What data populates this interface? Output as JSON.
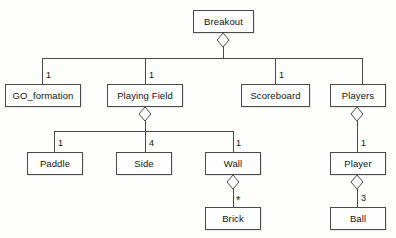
{
  "diagram": {
    "title": "Breakout",
    "type": "uml-aggregation-hierarchy",
    "background_color": "#fdfdfc",
    "line_color": "#4a4a4a",
    "text_color": "#131313",
    "nodes": [
      {
        "id": "breakout",
        "label": "Breakout",
        "x": 193,
        "y": 10,
        "w": 61,
        "h": 23
      },
      {
        "id": "go_formation",
        "label": "GO_formation",
        "x": 5,
        "y": 84,
        "w": 76,
        "h": 23
      },
      {
        "id": "playing_field",
        "label": "Playing Field",
        "x": 107,
        "y": 84,
        "w": 76,
        "h": 23
      },
      {
        "id": "scoreboard",
        "label": "Scoreboard",
        "x": 241,
        "y": 84,
        "w": 69,
        "h": 23
      },
      {
        "id": "players",
        "label": "Players",
        "x": 330,
        "y": 84,
        "w": 56,
        "h": 23
      },
      {
        "id": "paddle",
        "label": "Paddle",
        "x": 27,
        "y": 152,
        "w": 56,
        "h": 23
      },
      {
        "id": "side",
        "label": "Side",
        "x": 116,
        "y": 152,
        "w": 56,
        "h": 23
      },
      {
        "id": "wall",
        "label": "Wall",
        "x": 205,
        "y": 152,
        "w": 56,
        "h": 23
      },
      {
        "id": "player",
        "label": "Player",
        "x": 330,
        "y": 152,
        "w": 56,
        "h": 23
      },
      {
        "id": "brick",
        "label": "Brick",
        "x": 205,
        "y": 207,
        "w": 56,
        "h": 23
      },
      {
        "id": "ball",
        "label": "Ball",
        "x": 330,
        "y": 207,
        "w": 56,
        "h": 23
      }
    ],
    "multiplicities": [
      {
        "id": "mult-go-formation",
        "label": "1",
        "x": 46,
        "y": 71
      },
      {
        "id": "mult-playing-field",
        "label": "1",
        "x": 149,
        "y": 71
      },
      {
        "id": "mult-scoreboard",
        "label": "1",
        "x": 279,
        "y": 71
      },
      {
        "id": "mult-paddle",
        "label": "1",
        "x": 58,
        "y": 139
      },
      {
        "id": "mult-side",
        "label": "4",
        "x": 149,
        "y": 139
      },
      {
        "id": "mult-wall",
        "label": "1",
        "x": 236,
        "y": 139
      },
      {
        "id": "mult-player",
        "label": "1",
        "x": 361,
        "y": 139
      },
      {
        "id": "mult-brick",
        "label": "*",
        "x": 236,
        "y": 195
      },
      {
        "id": "mult-ball",
        "label": "3",
        "x": 361,
        "y": 194
      }
    ],
    "diamonds": [
      {
        "id": "diamond-breakout",
        "cx": 223,
        "cy": 40
      },
      {
        "id": "diamond-playing-field",
        "cx": 145,
        "cy": 114
      },
      {
        "id": "diamond-players",
        "cx": 357,
        "cy": 114
      },
      {
        "id": "diamond-wall",
        "cx": 233,
        "cy": 182
      },
      {
        "id": "diamond-player",
        "cx": 357,
        "cy": 182
      }
    ],
    "edges": [
      {
        "id": "edge-breakout-bus",
        "points": "223,46 223,58"
      },
      {
        "id": "edge-bus-top",
        "points": "42,58 362,58"
      },
      {
        "id": "edge-drop-go-formation",
        "points": "42,58 42,84"
      },
      {
        "id": "edge-drop-playing-field",
        "points": "145,58 145,84"
      },
      {
        "id": "edge-drop-scoreboard",
        "points": "275,58 275,84"
      },
      {
        "id": "edge-drop-players",
        "points": "362,58 362,84"
      },
      {
        "id": "edge-playing-field-bus",
        "points": "145,120 145,131"
      },
      {
        "id": "edge-bus-second",
        "points": "54,131 233,131"
      },
      {
        "id": "edge-drop-paddle",
        "points": "54,131 54,152"
      },
      {
        "id": "edge-drop-side",
        "points": "145,131 145,152"
      },
      {
        "id": "edge-drop-wall",
        "points": "233,131 233,152"
      },
      {
        "id": "edge-players-player",
        "points": "357,120 357,152"
      },
      {
        "id": "edge-wall-brick",
        "points": "233,188 233,207"
      },
      {
        "id": "edge-player-ball",
        "points": "357,188 357,207"
      }
    ]
  }
}
